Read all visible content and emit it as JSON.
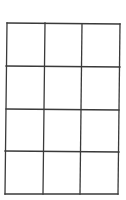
{
  "diagram": {
    "type": "grid",
    "rows": 4,
    "columns": 3,
    "line_color": "#3a3a3a",
    "background": "#ffffff",
    "outer_frame": {
      "top_left": [
        7,
        23
      ],
      "top_right": [
        120,
        24
      ],
      "bottom_right": [
        118,
        194
      ],
      "bottom_left": [
        5,
        194
      ]
    },
    "vertical_lines": [
      {
        "top": [
          45,
          23
        ],
        "bottom": [
          43,
          194
        ]
      },
      {
        "top": [
          82,
          24
        ],
        "bottom": [
          80,
          194
        ]
      }
    ],
    "horizontal_lines": [
      {
        "left": [
          6,
          66
        ],
        "right": [
          120,
          67
        ]
      },
      {
        "left": [
          6,
          109
        ],
        "right": [
          119,
          110
        ]
      },
      {
        "left": [
          5,
          151
        ],
        "right": [
          119,
          152
        ]
      }
    ]
  }
}
